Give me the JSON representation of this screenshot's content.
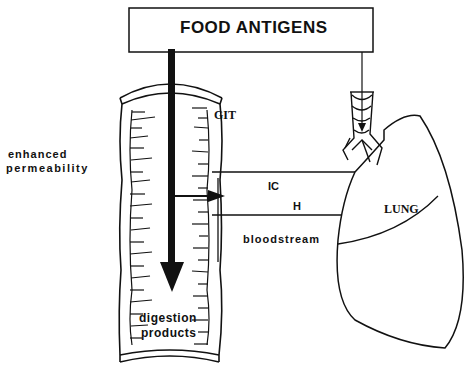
{
  "title_box": {
    "label": "FOOD ANTIGENS"
  },
  "labels": {
    "enhanced": "enhanced",
    "permeability": "permeability",
    "git": "GIT",
    "ic": "IC",
    "h": "H",
    "bloodstream": "bloodstream",
    "lung": "LUNG",
    "digestion": "digestion",
    "products": "products"
  },
  "colors": {
    "ink": "#111111",
    "background": "#ffffff"
  }
}
